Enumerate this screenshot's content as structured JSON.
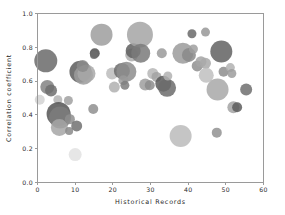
{
  "chart_data": {
    "type": "scatter",
    "title": "",
    "xlabel": "Historical Records",
    "ylabel": "Correlation coefficient",
    "xlim": [
      0,
      60
    ],
    "ylim": [
      0.0,
      1.0
    ],
    "xticks": [
      0,
      10,
      20,
      30,
      40,
      50,
      60
    ],
    "xticklabels": [
      "0",
      "10",
      "20",
      "30",
      "40",
      "50",
      "60"
    ],
    "yticks": [
      0.0,
      0.2,
      0.4,
      0.6,
      0.8,
      1.0
    ],
    "yticklabels": [
      "0.0",
      "0.2",
      "0.4",
      "0.6",
      "0.8",
      "1.0"
    ],
    "grid": false,
    "legend": null,
    "marker": "circle",
    "size_encodes": "bubble area",
    "colormap": "grayscale",
    "points": [
      {
        "x": 0.6,
        "y": 0.49,
        "size": 5.0,
        "color": "#d2d2d2"
      },
      {
        "x": 2.2,
        "y": 0.72,
        "size": 11.5,
        "color": "#6a6a6a"
      },
      {
        "x": 2.6,
        "y": 0.565,
        "size": 7.0,
        "color": "#838383"
      },
      {
        "x": 3.6,
        "y": 0.545,
        "size": 6.0,
        "color": "#6f6f6f"
      },
      {
        "x": 5.4,
        "y": 0.49,
        "size": 4.5,
        "color": "#b4b4b4"
      },
      {
        "x": 5.6,
        "y": 0.405,
        "size": 12.0,
        "color": "#545454"
      },
      {
        "x": 6.0,
        "y": 0.385,
        "size": 11.0,
        "color": "#7d7d7d"
      },
      {
        "x": 5.8,
        "y": 0.325,
        "size": 8.5,
        "color": "#a6a6a6"
      },
      {
        "x": 8.2,
        "y": 0.485,
        "size": 4.5,
        "color": "#a0a0a0"
      },
      {
        "x": 8.6,
        "y": 0.375,
        "size": 5.0,
        "color": "#8e8e8e"
      },
      {
        "x": 8.4,
        "y": 0.305,
        "size": 4.0,
        "color": "#8a8a8a"
      },
      {
        "x": 10.0,
        "y": 0.165,
        "size": 6.5,
        "color": "#e2e2e2"
      },
      {
        "x": 10.4,
        "y": 0.335,
        "size": 5.5,
        "color": "#717171"
      },
      {
        "x": 11.4,
        "y": 0.655,
        "size": 11.0,
        "color": "#5c5c5c"
      },
      {
        "x": 12.2,
        "y": 0.635,
        "size": 9.5,
        "color": "#9c9c9c"
      },
      {
        "x": 13.0,
        "y": 0.645,
        "size": 9.0,
        "color": "#a8a8a8"
      },
      {
        "x": 12.0,
        "y": 0.69,
        "size": 6.0,
        "color": "#8b8b8b"
      },
      {
        "x": 14.8,
        "y": 0.435,
        "size": 5.0,
        "color": "#8f8f8f"
      },
      {
        "x": 15.2,
        "y": 0.765,
        "size": 5.0,
        "color": "#4e4e4e"
      },
      {
        "x": 15.0,
        "y": 0.755,
        "size": 4.0,
        "color": "#6d6d6d"
      },
      {
        "x": 17.0,
        "y": 0.875,
        "size": 11.0,
        "color": "#9e9e9e"
      },
      {
        "x": 19.8,
        "y": 0.645,
        "size": 6.0,
        "color": "#bcbcbc"
      },
      {
        "x": 20.4,
        "y": 0.565,
        "size": 5.5,
        "color": "#b0b0b0"
      },
      {
        "x": 22.4,
        "y": 0.66,
        "size": 8.0,
        "color": "#6b6b6b"
      },
      {
        "x": 23.6,
        "y": 0.655,
        "size": 10.0,
        "color": "#8d8d8d"
      },
      {
        "x": 22.8,
        "y": 0.605,
        "size": 5.0,
        "color": "#9a9a9a"
      },
      {
        "x": 23.2,
        "y": 0.575,
        "size": 4.5,
        "color": "#7c7c7c"
      },
      {
        "x": 25.0,
        "y": 0.755,
        "size": 6.5,
        "color": "#adadad"
      },
      {
        "x": 25.4,
        "y": 0.78,
        "size": 7.5,
        "color": "#5f5f5f"
      },
      {
        "x": 27.2,
        "y": 0.875,
        "size": 13.0,
        "color": "#a5a5a5"
      },
      {
        "x": 27.4,
        "y": 0.765,
        "size": 9.5,
        "color": "#7a7a7a"
      },
      {
        "x": 28.6,
        "y": 0.58,
        "size": 6.0,
        "color": "#9d9d9d"
      },
      {
        "x": 29.8,
        "y": 0.575,
        "size": 5.0,
        "color": "#8c8c8c"
      },
      {
        "x": 30.6,
        "y": 0.645,
        "size": 5.5,
        "color": "#b6b6b6"
      },
      {
        "x": 31.6,
        "y": 0.625,
        "size": 5.0,
        "color": "#a2a2a2"
      },
      {
        "x": 33.0,
        "y": 0.765,
        "size": 5.0,
        "color": "#9a9a9a"
      },
      {
        "x": 33.4,
        "y": 0.585,
        "size": 8.0,
        "color": "#5a5a5a"
      },
      {
        "x": 34.4,
        "y": 0.56,
        "size": 9.0,
        "color": "#6c6c6c"
      },
      {
        "x": 34.6,
        "y": 0.63,
        "size": 4.5,
        "color": "#b2b2b2"
      },
      {
        "x": 38.0,
        "y": 0.275,
        "size": 11.0,
        "color": "#bbbbbb"
      },
      {
        "x": 38.6,
        "y": 0.765,
        "size": 10.5,
        "color": "#9b9b9b"
      },
      {
        "x": 40.2,
        "y": 0.755,
        "size": 7.0,
        "color": "#8a8a8a"
      },
      {
        "x": 41.0,
        "y": 0.88,
        "size": 4.5,
        "color": "#6a6a6a"
      },
      {
        "x": 41.4,
        "y": 0.79,
        "size": 4.5,
        "color": "#9f9f9f"
      },
      {
        "x": 42.4,
        "y": 0.69,
        "size": 5.5,
        "color": "#8f8f8f"
      },
      {
        "x": 43.4,
        "y": 0.715,
        "size": 5.5,
        "color": "#a4a4a4"
      },
      {
        "x": 44.6,
        "y": 0.89,
        "size": 4.5,
        "color": "#989898"
      },
      {
        "x": 44.6,
        "y": 0.705,
        "size": 5.5,
        "color": "#a9a9a9"
      },
      {
        "x": 44.8,
        "y": 0.635,
        "size": 7.5,
        "color": "#c0c0c0"
      },
      {
        "x": 47.6,
        "y": 0.295,
        "size": 5.0,
        "color": "#929292"
      },
      {
        "x": 47.8,
        "y": 0.55,
        "size": 11.0,
        "color": "#a8a8a8"
      },
      {
        "x": 48.8,
        "y": 0.775,
        "size": 11.0,
        "color": "#616161"
      },
      {
        "x": 49.4,
        "y": 0.655,
        "size": 5.0,
        "color": "#8d8d8d"
      },
      {
        "x": 51.2,
        "y": 0.68,
        "size": 4.5,
        "color": "#b1b1b1"
      },
      {
        "x": 51.6,
        "y": 0.645,
        "size": 4.5,
        "color": "#9c9c9c"
      },
      {
        "x": 52.0,
        "y": 0.445,
        "size": 6.0,
        "color": "#a3a3a3"
      },
      {
        "x": 53.0,
        "y": 0.445,
        "size": 5.0,
        "color": "#5d5d5d"
      },
      {
        "x": 55.4,
        "y": 0.55,
        "size": 6.0,
        "color": "#6e6e6e"
      }
    ]
  }
}
